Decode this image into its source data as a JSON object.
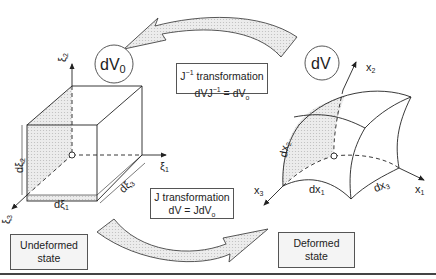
{
  "diagram": {
    "nodes": {
      "dV0": {
        "label": "dV",
        "sub": "0"
      },
      "dV": {
        "label": "dV"
      }
    },
    "transformations": {
      "inverse": {
        "line1_prefix": "J",
        "line1_sup": "−1",
        "line1_suffix": " transformation",
        "line2_a": "dVJ",
        "line2_sup": "−1",
        "line2_b": " = dV",
        "line2_sub": "o"
      },
      "forward": {
        "line1": "J transformation",
        "line2_a": "dV = JdV",
        "line2_sub": "o"
      }
    },
    "states": {
      "undeformed": {
        "line1": "Undeformed",
        "line2": "state"
      },
      "deformed": {
        "line1": "Deformed",
        "line2": "state"
      }
    },
    "undeformed_axes": {
      "xi1": {
        "sym": "ξ",
        "sub": "1"
      },
      "xi2": {
        "sym": "ξ",
        "sub": "2"
      },
      "xi3": {
        "sym": "ξ",
        "sub": "3"
      },
      "dxi1": {
        "sym": "dξ",
        "sub": "1"
      },
      "dxi2": {
        "sym": "dξ",
        "sub": "2"
      },
      "dxi3": {
        "sym": "dξ",
        "sub": "3"
      }
    },
    "deformed_axes": {
      "x1": {
        "sym": "x",
        "sub": "1"
      },
      "x2": {
        "sym": "x",
        "sub": "2"
      },
      "x3": {
        "sym": "x",
        "sub": "3"
      },
      "dx1": {
        "sym": "dx",
        "sub": "1"
      },
      "dx2": {
        "sym": "dx",
        "sub": "2"
      },
      "dx3": {
        "sym": "dx",
        "sub": "3"
      }
    },
    "colors": {
      "line": "#222222",
      "shade": "#e3e3e3",
      "arrow_fill": "#e6e6e6",
      "bottom_rule": "#444444"
    }
  }
}
